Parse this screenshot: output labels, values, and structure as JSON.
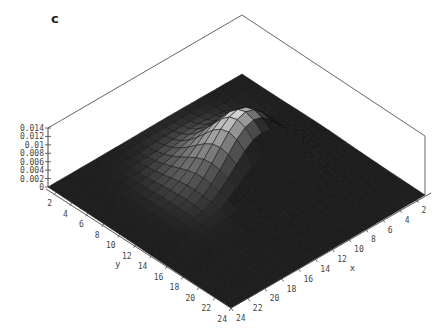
{
  "panel_label": "c",
  "chart_data": {
    "type": "surface3d",
    "title": "",
    "panel_label": "c",
    "xlabel": "x",
    "ylabel": "y",
    "zlabel": "",
    "x_ticks": [
      2,
      4,
      6,
      8,
      10,
      12,
      14,
      16,
      18,
      20,
      22,
      24
    ],
    "y_ticks": [
      2,
      4,
      6,
      8,
      10,
      12,
      14,
      16,
      18,
      20,
      22,
      24
    ],
    "z_ticks": [
      "0",
      "0.002",
      "0.004",
      "0.006",
      "0.008",
      "0.01",
      "0.012",
      "0.014"
    ],
    "xlim": [
      1,
      24
    ],
    "ylim": [
      1,
      24
    ],
    "zlim": [
      0,
      0.014
    ],
    "grid_size": [
      24,
      24
    ],
    "surface": {
      "form": "gaussian_peak",
      "peak_value": 0.014,
      "peak_x": 10,
      "peak_y": 11,
      "sigma": 3.2,
      "baseline": 0
    },
    "box": true,
    "shading": "grayscale"
  }
}
